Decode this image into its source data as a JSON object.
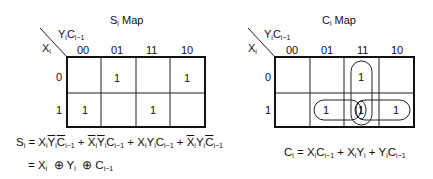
{
  "s_map": {
    "title_main": "S",
    "title_sub": "i",
    "title_rest": " Map",
    "col_var": "Y",
    "col_var_sub": "i",
    "col_var2": "C",
    "col_var2_sub": "i−1",
    "row_var": "X",
    "row_var_sub": "i",
    "columns": [
      "00",
      "01",
      "11",
      "10"
    ],
    "rows": [
      "0",
      "1"
    ],
    "cells": [
      [
        "",
        "1",
        "",
        "1"
      ],
      [
        "1",
        "",
        "1",
        ""
      ]
    ]
  },
  "c_map": {
    "title_main": "C",
    "title_sub": "i",
    "title_rest": " Map",
    "col_var": "Y",
    "col_var_sub": "i",
    "col_var2": "C",
    "col_var2_sub": "i−1",
    "row_var": "X",
    "row_var_sub": "i",
    "columns": [
      "00",
      "01",
      "11",
      "10"
    ],
    "rows": [
      "0",
      "1"
    ],
    "cells": [
      [
        "",
        "",
        "1",
        ""
      ],
      [
        "",
        "1",
        "1",
        "1"
      ]
    ],
    "groupings": [
      "vertical loop over column 11 (rows 0-1)",
      "horizontal loop over row 1 (columns 01-11)",
      "horizontal loop over row 1 (columns 11-10)"
    ]
  },
  "equations": {
    "s_line1": {
      "lhs": "S",
      "lhs_sub": "i",
      "eq": " = ",
      "terms": [
        {
          "parts": [
            {
              "v": "X",
              "s": "i",
              "bar": false
            },
            {
              "v": "Y",
              "s": "i",
              "bar": true
            },
            {
              "v": "C",
              "s": "i−1",
              "bar": true
            }
          ]
        },
        {
          "parts": [
            {
              "v": "X",
              "s": "i",
              "bar": true
            },
            {
              "v": "Y",
              "s": "i",
              "bar": true
            },
            {
              "v": "C",
              "s": "i−1",
              "bar": false
            }
          ]
        },
        {
          "parts": [
            {
              "v": "X",
              "s": "i",
              "bar": false
            },
            {
              "v": "Y",
              "s": "i",
              "bar": false
            },
            {
              "v": "C",
              "s": "i−1",
              "bar": false
            }
          ]
        },
        {
          "parts": [
            {
              "v": "X",
              "s": "i",
              "bar": true
            },
            {
              "v": "Y",
              "s": "i",
              "bar": false
            },
            {
              "v": "C",
              "s": "i−1",
              "bar": true
            }
          ]
        }
      ],
      "text": "Si = XiȲiC̄i−1 + X̄iȲiCi−1 + XiYiCi−1 + X̄iYiC̄i−1"
    },
    "s_line2": {
      "text": "= Xi ⊕ Yi ⊕ Ci−1"
    },
    "c_line": {
      "text": "Ci = XiCi−1 + XiYi + YiCi−1"
    }
  }
}
